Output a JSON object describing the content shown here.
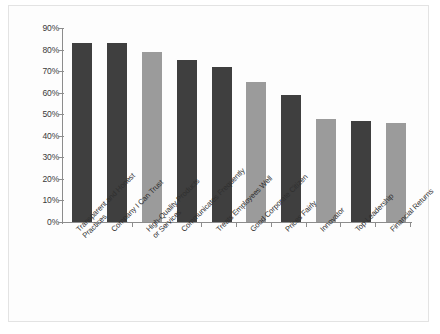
{
  "chart_data": {
    "type": "bar",
    "title": "",
    "subtitle": "",
    "xlabel": "",
    "ylabel": "",
    "ylim": [
      0,
      90
    ],
    "y_tick_values": [
      0,
      10,
      20,
      30,
      40,
      50,
      60,
      70,
      80,
      90
    ],
    "y_tick_labels": [
      "0%",
      "10%",
      "20%",
      "30%",
      "40%",
      "50%",
      "60%",
      "70%",
      "80%",
      "90%"
    ],
    "grid": false,
    "legend": "none",
    "value_suffix": "%",
    "categories": [
      "Transparent and Honest\nPractices",
      "Company I Can Trust",
      "High-Quality Products\nor Services",
      "Communicates Frequently",
      "Treats Employees Well",
      "Good Corporate Citizen",
      "Prices Fairly",
      "Innovator",
      "Top Leadership",
      "Financial Returns"
    ],
    "values": [
      83,
      83,
      79,
      75,
      72,
      65,
      59,
      48,
      47,
      46
    ],
    "bar_colors": [
      "#3f3f3f",
      "#3f3f3f",
      "#9b9b9b",
      "#3f3f3f",
      "#3f3f3f",
      "#9b9b9b",
      "#3f3f3f",
      "#9b9b9b",
      "#3f3f3f",
      "#9b9b9b"
    ]
  },
  "style": {
    "axis_color": "#8c8c8c",
    "text_color": "#2f2f2f",
    "card_background": "#fdfdfd",
    "card_border": "#e3e3e3",
    "page_background": "#ffffff",
    "dark_bar": "#3f3f3f",
    "light_bar": "#9b9b9b"
  }
}
